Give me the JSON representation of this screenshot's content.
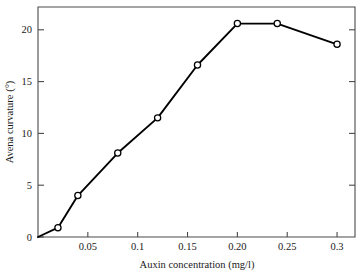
{
  "chart_data": {
    "type": "line",
    "title": "",
    "xlabel": "Auxin concentration (mg/l)",
    "ylabel": "Avena curvature (°)",
    "xlim": [
      0,
      0.318
    ],
    "ylim": [
      0,
      22.2
    ],
    "grid": false,
    "legend": false,
    "marker": "open-circle",
    "x": [
      0,
      0.02,
      0.04,
      0.08,
      0.12,
      0.16,
      0.2,
      0.24,
      0.3
    ],
    "values": [
      0,
      0.9,
      4.0,
      8.1,
      11.5,
      16.6,
      20.6,
      20.6,
      18.6
    ],
    "xticks": [
      {
        "value": 0.05,
        "label": "0.05"
      },
      {
        "value": 0.1,
        "label": "0.1"
      },
      {
        "value": 0.15,
        "label": "0.15"
      },
      {
        "value": 0.2,
        "label": "0.20"
      },
      {
        "value": 0.25,
        "label": "0.25"
      },
      {
        "value": 0.3,
        "label": "0.3"
      }
    ],
    "yticks": [
      {
        "value": 0,
        "label": "0"
      },
      {
        "value": 5,
        "label": "5"
      },
      {
        "value": 10,
        "label": "10"
      },
      {
        "value": 15,
        "label": "15"
      },
      {
        "value": 20,
        "label": "20"
      }
    ],
    "colors": {
      "line": "#000000",
      "marker_fill": "#ffffff",
      "marker_stroke": "#000000",
      "axis": "#4a4a4a",
      "background": "#ffffff",
      "text": "#1a1a1a"
    }
  }
}
